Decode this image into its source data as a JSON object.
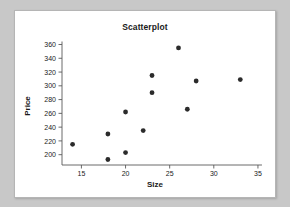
{
  "chart_data": {
    "type": "scatter",
    "title": "Scatterplot",
    "xlabel": "Size",
    "ylabel": "Price",
    "xlim": [
      12.8,
      35.8
    ],
    "ylim": [
      185,
      368
    ],
    "grid": false,
    "legend": null,
    "xticks": [
      15,
      20,
      25,
      30,
      35
    ],
    "yticks": [
      200,
      220,
      240,
      260,
      280,
      300,
      320,
      340,
      360
    ],
    "marker": "filled-circle",
    "marker_color": "#2b2b2b",
    "points": [
      {
        "x": 14,
        "y": 215
      },
      {
        "x": 18,
        "y": 230
      },
      {
        "x": 18,
        "y": 193
      },
      {
        "x": 20,
        "y": 203
      },
      {
        "x": 20,
        "y": 262
      },
      {
        "x": 22,
        "y": 235
      },
      {
        "x": 23,
        "y": 315
      },
      {
        "x": 23,
        "y": 290
      },
      {
        "x": 26,
        "y": 355
      },
      {
        "x": 27,
        "y": 266
      },
      {
        "x": 28,
        "y": 307
      },
      {
        "x": 33,
        "y": 309
      }
    ]
  },
  "figure": {
    "background_color": "#c8c8c8",
    "card_color": "#ffffff"
  }
}
